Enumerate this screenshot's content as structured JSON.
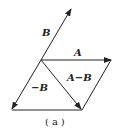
{
  "figure": {
    "caption": "(a)",
    "vectors": [
      {
        "name": "B",
        "label": "B"
      },
      {
        "name": "A",
        "label": "A"
      },
      {
        "name": "-B",
        "label": "−B"
      },
      {
        "name": "A-B",
        "label": "A−B"
      }
    ],
    "stroke_color": "#222222"
  }
}
